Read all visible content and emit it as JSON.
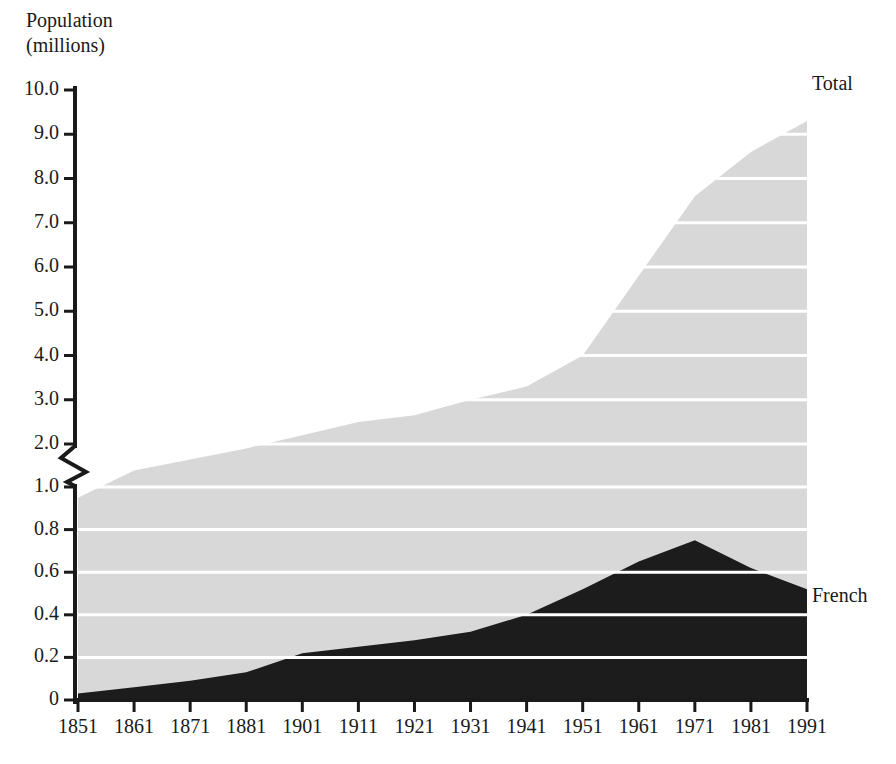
{
  "chart_data": {
    "type": "area",
    "title_lines": [
      "Population",
      "(millions)"
    ],
    "xlabel": "",
    "ylabel": "Population (millions)",
    "stacked": true,
    "grid": true,
    "grid_color": "#ffffff",
    "legend_position": "right-inline",
    "axis_break": {
      "present": true,
      "between": [
        1.0,
        2.0
      ],
      "style": "zigzag"
    },
    "yaxis": {
      "tick_labels": [
        "10.0",
        "9.0",
        "8.0",
        "7.0",
        "6.0",
        "5.0",
        "4.0",
        "3.0",
        "2.0",
        "1.0",
        "0.8",
        "0.6",
        "0.4",
        "0.2",
        "0"
      ],
      "tick_values": [
        10.0,
        9.0,
        8.0,
        7.0,
        6.0,
        5.0,
        4.0,
        3.0,
        2.0,
        1.0,
        0.8,
        0.6,
        0.4,
        0.2,
        0
      ],
      "lower_segment_range": [
        0,
        1.0
      ],
      "upper_segment_range": [
        2.0,
        10.0
      ]
    },
    "xaxis": {
      "tick_labels": [
        "1851",
        "1861",
        "1871",
        "1881",
        "1901",
        "1911",
        "1921",
        "1931",
        "1941",
        "1951",
        "1961",
        "1971",
        "1981",
        "1991"
      ],
      "tick_values": [
        1851,
        1861,
        1871,
        1881,
        1901,
        1911,
        1921,
        1931,
        1941,
        1951,
        1961,
        1971,
        1981,
        1991
      ],
      "note_missing_tick": "1891"
    },
    "x": [
      1851,
      1861,
      1871,
      1881,
      1901,
      1911,
      1921,
      1931,
      1941,
      1951,
      1961,
      1971,
      1981,
      1991
    ],
    "series": [
      {
        "name": "Total",
        "color": "#d8d8d8",
        "values": [
          0.95,
          1.4,
          1.65,
          1.9,
          2.2,
          2.5,
          2.65,
          3.0,
          3.3,
          4.0,
          5.8,
          7.6,
          8.6,
          9.3
        ]
      },
      {
        "name": "French",
        "color": "#1c1c1c",
        "values": [
          0.03,
          0.06,
          0.09,
          0.13,
          0.22,
          0.25,
          0.28,
          0.32,
          0.4,
          0.52,
          0.65,
          0.75,
          0.62,
          0.52
        ]
      }
    ],
    "annotations": [
      {
        "text": "Total",
        "position": "top-right"
      },
      {
        "text": "French",
        "position": "mid-right"
      }
    ]
  },
  "colors": {
    "total_fill": "#d8d8d8",
    "french_fill": "#1c1c1c",
    "gridline": "#ffffff",
    "axis": "#1a1a1a",
    "background": "#ffffff"
  }
}
